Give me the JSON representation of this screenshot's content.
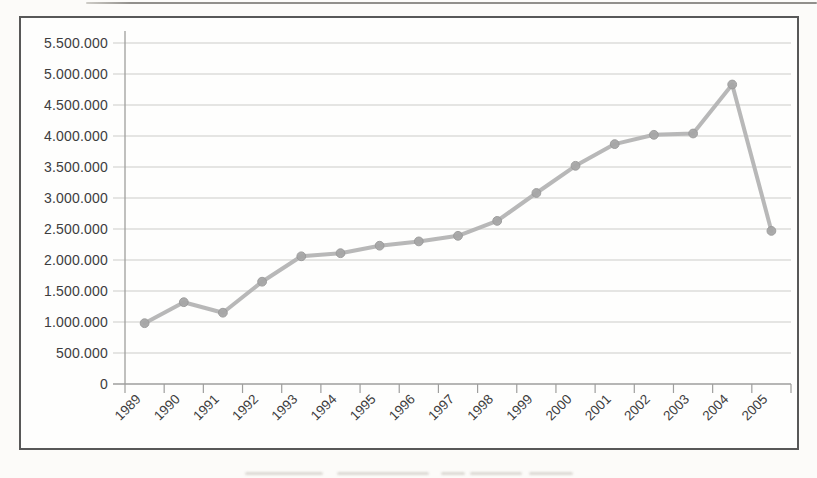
{
  "chart_data": {
    "type": "line",
    "title": "",
    "xlabel": "",
    "ylabel": "",
    "legend": "none",
    "grid": "horizontal",
    "number_format": "dot-thousands",
    "x_label_rotation_deg": -45,
    "categories": [
      "1989",
      "1990",
      "1991",
      "1992",
      "1993",
      "1994",
      "1995",
      "1996",
      "1997",
      "1998",
      "1999",
      "2000",
      "2001",
      "2002",
      "2003",
      "2004",
      "2005"
    ],
    "values": [
      980000,
      1320000,
      1150000,
      1650000,
      2060000,
      2110000,
      2230000,
      2300000,
      2390000,
      2630000,
      3080000,
      3520000,
      3870000,
      4020000,
      4040000,
      4830000,
      2470000
    ],
    "ylim": [
      0,
      5500000
    ],
    "y_ticks": [
      {
        "value": 5500000,
        "label": "5.500.000"
      },
      {
        "value": 5000000,
        "label": "5.000.000"
      },
      {
        "value": 4500000,
        "label": "4.500.000"
      },
      {
        "value": 4000000,
        "label": "4.000.000"
      },
      {
        "value": 3500000,
        "label": "3.500.000"
      },
      {
        "value": 3000000,
        "label": "3.000.000"
      },
      {
        "value": 2500000,
        "label": "2.500.000"
      },
      {
        "value": 2000000,
        "label": "2.000.000"
      },
      {
        "value": 1500000,
        "label": "1.500.000"
      },
      {
        "value": 1000000,
        "label": "1.000.000"
      },
      {
        "value": 500000,
        "label": "500.000"
      },
      {
        "value": 0,
        "label": "0"
      }
    ],
    "colors": {
      "line": "#b4b4b4",
      "marker": "#a7a7a7",
      "marker_edge": "#999999",
      "grid": "#cbcbca",
      "axis": "#9e9e9d",
      "tick_text": "#3d3d3d",
      "frame_border": "#585858",
      "page_rule": "#918f8b"
    }
  }
}
